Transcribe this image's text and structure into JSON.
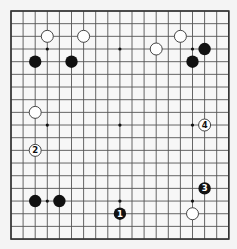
{
  "board": {
    "size": 19,
    "background": "#f7f7f7",
    "line_color": "#555555",
    "border_color": "#333333",
    "origin_x": 11,
    "origin_y": 11,
    "spacing_x": 12.1,
    "spacing_y": 12.67,
    "hoshi": [
      [
        3,
        3
      ],
      [
        9,
        3
      ],
      [
        15,
        3
      ],
      [
        3,
        9
      ],
      [
        9,
        9
      ],
      [
        15,
        9
      ],
      [
        3,
        15
      ],
      [
        9,
        15
      ],
      [
        15,
        15
      ]
    ]
  },
  "stones": [
    {
      "color": "white",
      "col": 3,
      "row": 2,
      "label": ""
    },
    {
      "color": "white",
      "col": 6,
      "row": 2,
      "label": ""
    },
    {
      "color": "black",
      "col": 2,
      "row": 4,
      "label": ""
    },
    {
      "color": "black",
      "col": 5,
      "row": 4,
      "label": ""
    },
    {
      "color": "white",
      "col": 14,
      "row": 2,
      "label": ""
    },
    {
      "color": "white",
      "col": 12,
      "row": 3,
      "label": ""
    },
    {
      "color": "black",
      "col": 16,
      "row": 3,
      "label": ""
    },
    {
      "color": "black",
      "col": 15,
      "row": 4,
      "label": ""
    },
    {
      "color": "white",
      "col": 2,
      "row": 8,
      "label": ""
    },
    {
      "color": "white",
      "col": 2,
      "row": 11,
      "label": "2"
    },
    {
      "color": "white",
      "col": 16,
      "row": 9,
      "label": "4"
    },
    {
      "color": "black",
      "col": 2,
      "row": 15,
      "label": ""
    },
    {
      "color": "black",
      "col": 4,
      "row": 15,
      "label": ""
    },
    {
      "color": "black",
      "col": 9,
      "row": 16,
      "label": "1"
    },
    {
      "color": "black",
      "col": 16,
      "row": 14,
      "label": "3"
    },
    {
      "color": "white",
      "col": 15,
      "row": 16,
      "label": ""
    }
  ]
}
